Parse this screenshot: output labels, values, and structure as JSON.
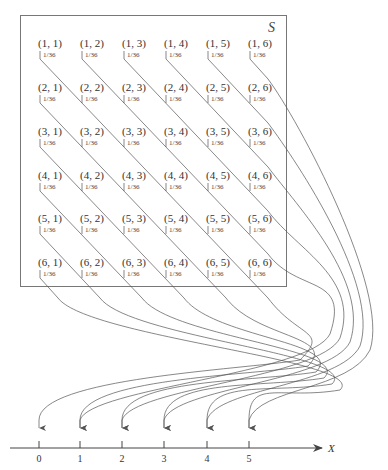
{
  "diagram": {
    "sample_space_label": "S",
    "cell_probability": "1/36",
    "rows": [
      [
        "(1, 1)",
        "(1, 2)",
        "(1, 3)",
        "(1, 4)",
        "(1, 5)",
        "(1, 6)"
      ],
      [
        "(2, 1)",
        "(2, 2)",
        "(2, 3)",
        "(2, 4)",
        "(2, 5)",
        "(2, 6)"
      ],
      [
        "(3, 1)",
        "(3, 2)",
        "(3, 3)",
        "(3, 4)",
        "(3, 5)",
        "(3, 6)"
      ],
      [
        "(4, 1)",
        "(4, 2)",
        "(4, 3)",
        "(4, 4)",
        "(4, 5)",
        "(4, 6)"
      ],
      [
        "(5, 1)",
        "(5, 2)",
        "(5, 3)",
        "(5, 4)",
        "(5, 5)",
        "(5, 6)"
      ],
      [
        "(6, 1)",
        "(6, 2)",
        "(6, 3)",
        "(6, 4)",
        "(6, 5)",
        "(6, 6)"
      ]
    ],
    "axis": {
      "label": "X",
      "ticks": [
        "0",
        "1",
        "2",
        "3",
        "4",
        "5"
      ]
    },
    "mapping_description": "Each diagonal of outcomes (i, j) with the same |i - j| maps to value X = |i - j| on the number line",
    "colors": {
      "line": "#555555",
      "box": "#777777",
      "text": "#333333"
    }
  }
}
